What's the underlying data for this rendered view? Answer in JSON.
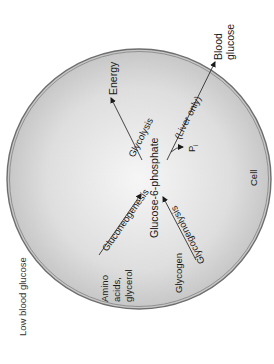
{
  "diagram": {
    "title_note": "Low blood glucose",
    "compartment": "Cell",
    "center": "Glucose-6-phosphate",
    "nodes": {
      "energy": "Energy",
      "blood_glucose_line1": "Blood",
      "blood_glucose_line2": "glucose",
      "precursors_line1": "Amino",
      "precursors_line2": "acids,",
      "precursors_line3": "glycerol",
      "glycogen": "Glycogen",
      "pi": "P",
      "pi_sub": "i"
    },
    "pathways": {
      "glycolysis": "Glycolysis",
      "gluconeogenesis": "Gluconeogenesis",
      "glycogenolysis": "Glycogenolysis",
      "liver_only": "(Liver only)"
    },
    "edges": [
      {
        "from": "Glucose-6-phosphate",
        "to": "Energy",
        "label": "Glycolysis"
      },
      {
        "from": "Amino acids, glycerol",
        "to": "Glucose-6-phosphate",
        "label": "Gluconeogenesis"
      },
      {
        "from": "Glycogen",
        "to": "Glucose-6-phosphate",
        "label": "Glycogenolysis"
      },
      {
        "from": "Glucose-6-phosphate",
        "to": "Blood glucose",
        "label": "(Liver only)",
        "byproduct": "Pi"
      }
    ],
    "colors": {
      "cell_fill_center": "#f4f4f4",
      "cell_fill_edge": "#c8c8c8",
      "membrane": "#6e6e6e",
      "text": "#1a1a1a"
    }
  }
}
